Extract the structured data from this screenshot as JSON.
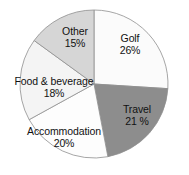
{
  "chart_data": {
    "type": "pie",
    "title": "",
    "subtitle": "",
    "xlabel": "",
    "ylabel": "",
    "legend_position": "none",
    "grid": false,
    "labels_inside": true,
    "start_angle_deg": 0,
    "direction": "clockwise",
    "categories": [
      "Golf",
      "Travel",
      "Accommodation",
      "Food & beverage",
      "Other"
    ],
    "values": [
      26,
      21,
      20,
      18,
      15
    ],
    "value_unit": "%",
    "slices": [
      {
        "name": "Golf",
        "value": 26,
        "value_text": "26%",
        "color": "#fbfbfb",
        "start_deg": 0,
        "end_deg": 93.6,
        "label_name": "Golf",
        "label_pct": "26%"
      },
      {
        "name": "Travel",
        "value": 21,
        "value_text": "21 %",
        "color": "#8d8d8d",
        "start_deg": 93.6,
        "end_deg": 169.2,
        "label_name": "Travel",
        "label_pct": "21 %"
      },
      {
        "name": "Accommodation",
        "value": 20,
        "value_text": "20%",
        "color": "#fdfdfd",
        "start_deg": 169.2,
        "end_deg": 241.2,
        "label_name": "Accommodation",
        "label_pct": "20%"
      },
      {
        "name": "Food & beverage",
        "value": 18,
        "value_text": "18%",
        "color": "#f4f4f4",
        "start_deg": 241.2,
        "end_deg": 306.0,
        "label_name": "Food & beverage",
        "label_pct": "18%"
      },
      {
        "name": "Other",
        "value": 15,
        "value_text": "15%",
        "color": "#d6d6d6",
        "start_deg": 306.0,
        "end_deg": 360.0,
        "label_name": "Other",
        "label_pct": "15%"
      }
    ],
    "geometry": {
      "center_x": 94,
      "center_y": 84,
      "radius": 74
    },
    "style": {
      "outline_color": "#8f8f8f",
      "outline_width": 0.8,
      "background": "#ffffff",
      "label_color": "#111111"
    }
  }
}
